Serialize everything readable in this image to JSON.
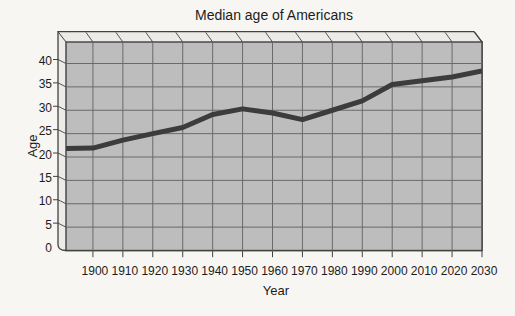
{
  "page": {
    "background": "#f7f6f3"
  },
  "chart_data": {
    "type": "line",
    "title": "Median age of Americans",
    "xlabel": "Year",
    "ylabel": "Age",
    "x": [
      1890,
      1900,
      1910,
      1920,
      1930,
      1940,
      1950,
      1960,
      1970,
      1980,
      1990,
      2000,
      2010,
      2020,
      2030
    ],
    "values": [
      21.8,
      21.9,
      23.6,
      25.0,
      26.3,
      29.1,
      30.3,
      29.4,
      28.0,
      30.0,
      32.0,
      35.5,
      36.3,
      37.1,
      38.4
    ],
    "xticks": [
      1900,
      1910,
      1920,
      1930,
      1940,
      1950,
      1960,
      1970,
      1980,
      1990,
      2000,
      2010,
      2020,
      2030
    ],
    "yticks": [
      0,
      5,
      10,
      15,
      20,
      25,
      30,
      35,
      40
    ],
    "xlim": [
      1891,
      2030
    ],
    "ylim": [
      0,
      44.6
    ],
    "grid": true,
    "legend": "none",
    "style_3d_slab": true,
    "colors": {
      "line": "#3c3c3c",
      "plot_face": "#bdbdbd",
      "side_face": "#ecebe7",
      "gridline": "#6a6a6a",
      "frame": "#424242",
      "text": "#1c1c1c"
    }
  }
}
